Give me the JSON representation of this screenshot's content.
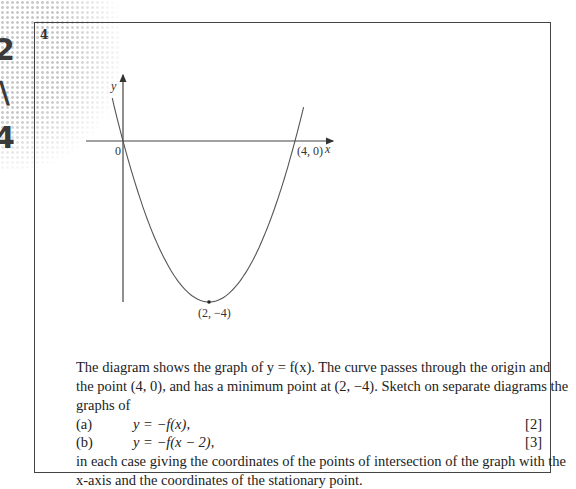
{
  "question": {
    "number": "4",
    "graph": {
      "axis_labels": {
        "x": "x",
        "y": "y"
      },
      "points": {
        "origin": "0",
        "root": "(4, 0)",
        "minimum": "(2, −4)"
      }
    },
    "intro_lines": [
      "The diagram shows the graph of y = f(x). The curve passes through the origin and",
      "the point (4, 0), and has a minimum point at (2, −4). Sketch on separate diagrams the",
      "graphs of"
    ],
    "parts": [
      {
        "label": "(a)",
        "equation": "y = −f(x),",
        "marks": "[2]"
      },
      {
        "label": "(b)",
        "equation": "y = −f(x − 2),",
        "marks": "[3]"
      }
    ],
    "closing_lines": [
      "in each case giving the coordinates of the points of intersection of the graph with the",
      "x-axis and the coordinates of the stationary point."
    ]
  }
}
